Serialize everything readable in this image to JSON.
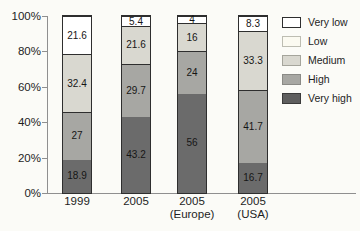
{
  "page": {
    "background_color": "#fbfbf7",
    "text_color": "#1e1e1e",
    "axis_color": "#8f8f8f",
    "bar_border_color": "#2e2e2e"
  },
  "chart_data": {
    "type": "bar",
    "subtype": "stacked-100-percent",
    "title": "",
    "xlabel": "",
    "ylabel": "",
    "grid": false,
    "legend_position": "right",
    "y_axis": {
      "min": 0,
      "max": 100,
      "ticks": [
        {
          "label": "0%",
          "value": 0
        },
        {
          "label": "20%",
          "value": 20
        },
        {
          "label": "40%",
          "value": 40
        },
        {
          "label": "60%",
          "value": 60
        },
        {
          "label": "80%",
          "value": 80
        },
        {
          "label": "100%",
          "value": 100
        }
      ]
    },
    "categories": [
      {
        "line1": "1999",
        "line2": ""
      },
      {
        "line1": "2005",
        "line2": ""
      },
      {
        "line1": "2005",
        "line2": "(Europe)"
      },
      {
        "line1": "2005",
        "line2": "(USA)"
      }
    ],
    "series_bottom_up": [
      {
        "name": "Very high",
        "color": "#6b6b6b",
        "values": [
          18.9,
          43.2,
          56,
          16.7
        ],
        "labels": [
          "18.9",
          "43.2",
          "56",
          "16.7"
        ]
      },
      {
        "name": "High",
        "color": "#a7a7a3",
        "values": [
          27,
          29.7,
          24,
          41.7
        ],
        "labels": [
          "27",
          "29.7",
          "24",
          "41.7"
        ]
      },
      {
        "name": "Medium",
        "color": "#d9d8d0",
        "values": [
          32.4,
          21.6,
          16,
          33.3
        ],
        "labels": [
          "32.4",
          "21.6",
          "16",
          "33.3"
        ]
      },
      {
        "name": "Very low",
        "color": "#ffffff",
        "values": [
          21.6,
          5.4,
          4,
          8.3
        ],
        "labels": [
          "21.6",
          "5.4",
          "4",
          "8.3"
        ]
      }
    ],
    "legend": [
      {
        "label": "Very low",
        "color": "#ffffff",
        "border": "#2e2e2e"
      },
      {
        "label": "Low",
        "color": "#fbfaf1",
        "border": "#bdbdb2"
      },
      {
        "label": "Medium",
        "color": "#d9d8d0",
        "border": "#a5a59c"
      },
      {
        "label": "High",
        "color": "#a7a7a3",
        "border": "#8a8a86"
      },
      {
        "label": "Very high",
        "color": "#5e5e5e",
        "border": "#3a3a3a"
      }
    ]
  },
  "layout_text": {}
}
